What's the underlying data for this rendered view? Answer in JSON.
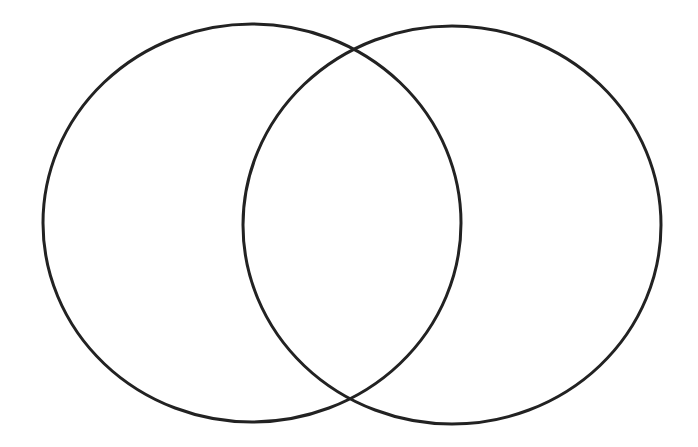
{
  "diagram": {
    "type": "venn",
    "background": "#ffffff",
    "stroke_color": "#222222",
    "stroke_width": 3,
    "sets": [
      {
        "name": "left-set",
        "label": "",
        "cx": 252,
        "cy": 223,
        "rx": 209,
        "ry": 199
      },
      {
        "name": "right-set",
        "label": "",
        "cx": 452,
        "cy": 225,
        "rx": 209,
        "ry": 199
      }
    ],
    "intersection_label": ""
  }
}
